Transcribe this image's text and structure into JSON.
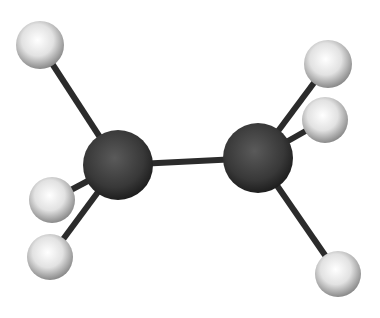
{
  "diagram": {
    "colors": {
      "background": "#ffffff",
      "carbon": "#3a3a3a",
      "hydrogen": "#e8e8e8",
      "bond": "#2b2b2b"
    },
    "atoms": [
      {
        "id": "C1",
        "element": "C",
        "cx": 118,
        "cy": 165,
        "r": 35
      },
      {
        "id": "C2",
        "element": "C",
        "cx": 258,
        "cy": 158,
        "r": 35
      },
      {
        "id": "H1",
        "element": "H",
        "cx": 40,
        "cy": 45,
        "r": 24
      },
      {
        "id": "H2",
        "element": "H",
        "cx": 328,
        "cy": 64,
        "r": 24
      },
      {
        "id": "H3",
        "element": "H",
        "cx": 325,
        "cy": 120,
        "r": 23
      },
      {
        "id": "H4",
        "element": "H",
        "cx": 52,
        "cy": 200,
        "r": 23
      },
      {
        "id": "H5",
        "element": "H",
        "cx": 50,
        "cy": 257,
        "r": 23
      },
      {
        "id": "H6",
        "element": "H",
        "cx": 338,
        "cy": 274,
        "r": 23
      }
    ],
    "bonds": [
      {
        "from": "C1",
        "to": "C2"
      },
      {
        "from": "C1",
        "to": "H1"
      },
      {
        "from": "C1",
        "to": "H4"
      },
      {
        "from": "C1",
        "to": "H5"
      },
      {
        "from": "C2",
        "to": "H2"
      },
      {
        "from": "C2",
        "to": "H3"
      },
      {
        "from": "C2",
        "to": "H6"
      }
    ]
  }
}
